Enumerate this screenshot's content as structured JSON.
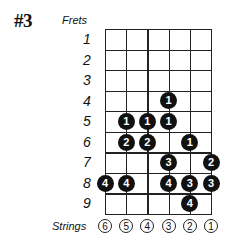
{
  "diagram": {
    "title": "#3",
    "frets_label": "Frets",
    "strings_label": "Strings",
    "fret_numbers": [
      "1",
      "2",
      "3",
      "4",
      "5",
      "6",
      "7",
      "8",
      "9"
    ],
    "string_numbers": [
      "6",
      "5",
      "4",
      "3",
      "2",
      "1"
    ],
    "dots": [
      {
        "fret": 4,
        "string": 3,
        "finger": "1"
      },
      {
        "fret": 5,
        "string": 5,
        "finger": "1"
      },
      {
        "fret": 5,
        "string": 4,
        "finger": "1"
      },
      {
        "fret": 5,
        "string": 3,
        "finger": "1"
      },
      {
        "fret": 6,
        "string": 5,
        "finger": "2"
      },
      {
        "fret": 6,
        "string": 4,
        "finger": "2"
      },
      {
        "fret": 6,
        "string": 2,
        "finger": "1"
      },
      {
        "fret": 7,
        "string": 3,
        "finger": "3"
      },
      {
        "fret": 7,
        "string": 1,
        "finger": "2"
      },
      {
        "fret": 8,
        "string": 6,
        "finger": "4"
      },
      {
        "fret": 8,
        "string": 5,
        "finger": "4"
      },
      {
        "fret": 8,
        "string": 3,
        "finger": "4"
      },
      {
        "fret": 8,
        "string": 2,
        "finger": "3"
      },
      {
        "fret": 8,
        "string": 1,
        "finger": "3"
      },
      {
        "fret": 9,
        "string": 2,
        "finger": "4"
      }
    ]
  }
}
